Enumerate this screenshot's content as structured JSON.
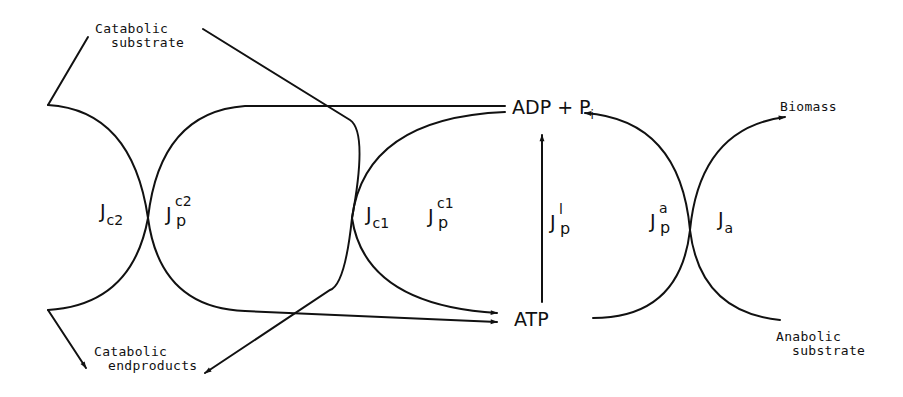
{
  "diagram": {
    "type": "metabolic coupling scheme",
    "nodes": {
      "catabolic_substrate": {
        "line1": "Catabolic",
        "line2": "substrate"
      },
      "catabolic_endproducts": {
        "line1": "Catabolic",
        "line2": "endproducts"
      },
      "adp_pi": {
        "main": "ADP + P",
        "sub": "i"
      },
      "atp": {
        "label": "ATP"
      },
      "biomass": {
        "label": "Biomass"
      },
      "anabolic_substrate": {
        "line1": "Anabolic",
        "line2": "substrate"
      }
    },
    "fluxes": {
      "jc2": {
        "main": "J",
        "sub": "c2"
      },
      "jp_c2": {
        "main": "J",
        "sub": "p",
        "sup": "c2"
      },
      "jc1": {
        "main": "J",
        "sub": "c1"
      },
      "jp_c1": {
        "main": "J",
        "sub": "p",
        "sup": "c1"
      },
      "jp_l": {
        "main": "J",
        "sub": "p",
        "sup": "l"
      },
      "jp_a": {
        "main": "J",
        "sub": "p",
        "sup": "a"
      },
      "ja": {
        "main": "J",
        "sub": "a"
      }
    },
    "colors": {
      "stroke": "#111111",
      "background": "#ffffff"
    }
  }
}
